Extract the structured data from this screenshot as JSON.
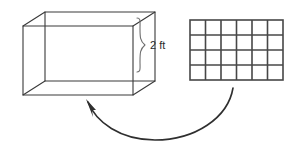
{
  "figure": {
    "dimension_label": "2 ft",
    "colors": {
      "prism_stroke": "#3a3a3a",
      "grid_stroke": "#474747",
      "brace_stroke": "#6e6e6e",
      "arrow_stroke": "#2f2f2f",
      "background": "#ffffff",
      "text": "#2b2b2b"
    },
    "prism": {
      "name": "rectangular prism",
      "height_label": "2 ft",
      "front_face": {
        "x": 23,
        "y": 26,
        "width": 110,
        "height": 69
      },
      "depth_offset": {
        "dx": 22,
        "dy": -14
      }
    },
    "grid": {
      "name": "unit square grid",
      "columns": 6,
      "rows": 4,
      "total_squares": 24,
      "bounds": {
        "x": 190,
        "y": 20,
        "width": 93,
        "height": 60
      }
    },
    "brace": {
      "name": "height brace",
      "top_y": 18,
      "bottom_y": 72,
      "x": 139
    },
    "arrow": {
      "name": "curved arrow",
      "direction": "right-to-left",
      "tail": {
        "x": 233,
        "y": 88
      },
      "tip": {
        "x": 86,
        "y": 100
      }
    }
  }
}
